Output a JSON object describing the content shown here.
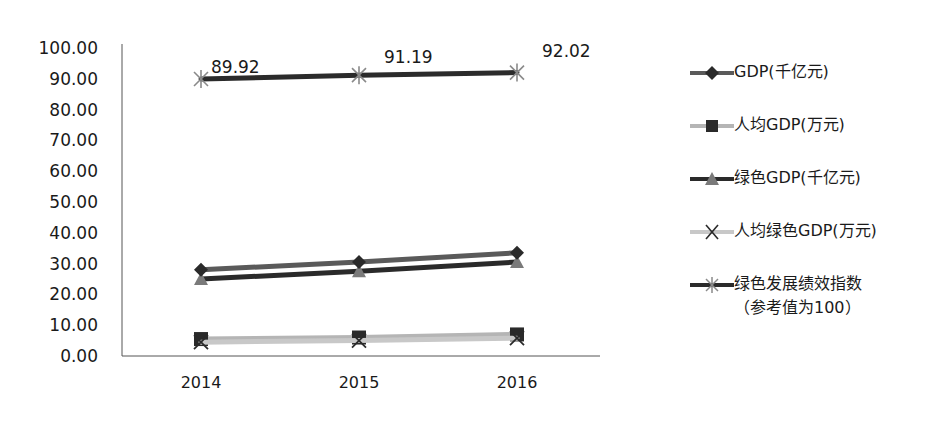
{
  "chart_data": {
    "type": "line",
    "title": "",
    "xlabel": "",
    "ylabel": "",
    "categories": [
      "2014",
      "2015",
      "2016"
    ],
    "ylim": [
      0,
      100
    ],
    "yticks": [
      "0.00",
      "10.00",
      "20.00",
      "30.00",
      "40.00",
      "50.00",
      "60.00",
      "70.00",
      "80.00",
      "90.00",
      "100.00"
    ],
    "grid": false,
    "legend_position": "right",
    "series": [
      {
        "name": "GDP(千亿元)",
        "marker": "diamond",
        "color": "#5a5a5a",
        "values": [
          28.0,
          30.5,
          33.5
        ]
      },
      {
        "name": "人均GDP(万元)",
        "marker": "square",
        "color": "#b5b5b5",
        "values": [
          5.5,
          6.0,
          7.0
        ]
      },
      {
        "name": "绿色GDP(千亿元)",
        "marker": "triangle",
        "color": "#2a2a2a",
        "values": [
          25.0,
          27.5,
          30.5
        ]
      },
      {
        "name": "人均绿色GDP(万元)",
        "marker": "x",
        "color": "#c8c8c8",
        "values": [
          4.5,
          5.0,
          5.8
        ]
      },
      {
        "name": "绿色发展绩效指数（参考值为100）",
        "marker": "star",
        "color": "#2b2b2b",
        "values": [
          89.92,
          91.19,
          92.02
        ],
        "data_labels": [
          "89.92",
          "91.19",
          "92.02"
        ]
      }
    ]
  },
  "legend": {
    "items": [
      {
        "label": "GDP(千亿元)"
      },
      {
        "label": "人均GDP(万元)"
      },
      {
        "label": "绿色GDP(千亿元)"
      },
      {
        "label": "人均绿色GDP(万元)"
      },
      {
        "label": "绿色发展绩效指数\n（参考值为100）"
      }
    ]
  }
}
